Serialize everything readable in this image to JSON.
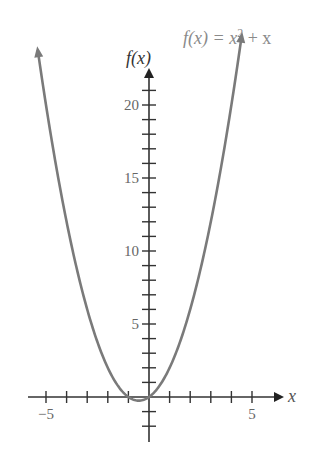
{
  "chart_data": {
    "type": "line",
    "title": "",
    "function_label": "f(x) = x² + x",
    "function_label_parts": {
      "lhs": "f(x) = x",
      "exp": "2",
      "rhs": " + x"
    },
    "xlabel": "x",
    "ylabel": "f(x)",
    "xlim": [
      -5.4,
      4.5
    ],
    "ylim": [
      -2,
      24
    ],
    "x_ticks": [
      -5,
      -4,
      -3,
      -2,
      -1,
      1,
      2,
      3,
      4,
      5
    ],
    "x_tick_labels": [
      {
        "value": -5,
        "label": "−5"
      },
      {
        "value": 5,
        "label": "5"
      }
    ],
    "y_ticks": [
      -2,
      -1,
      1,
      2,
      3,
      4,
      5,
      6,
      7,
      8,
      9,
      10,
      11,
      12,
      13,
      14,
      15,
      16,
      17,
      18,
      19,
      20,
      21
    ],
    "y_tick_labels": [
      {
        "value": 5,
        "label": "5"
      },
      {
        "value": 10,
        "label": "10"
      },
      {
        "value": 15,
        "label": "15"
      },
      {
        "value": 20,
        "label": "20"
      }
    ],
    "grid": false,
    "legend": "none",
    "series": [
      {
        "name": "f(x) = x^2 + x",
        "x": [
          -5.4,
          -5,
          -4,
          -3,
          -2,
          -1,
          -0.5,
          0,
          1,
          2,
          3,
          4,
          4.5
        ],
        "values": [
          23.76,
          20,
          12,
          6,
          2,
          0,
          -0.25,
          0,
          2,
          6,
          12,
          20,
          24.75
        ]
      }
    ],
    "colors": {
      "curve": "#7a7a7a",
      "axes": "#333333",
      "text": "#666666"
    }
  }
}
